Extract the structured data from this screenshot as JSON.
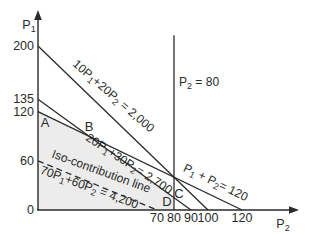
{
  "figure": {
    "background": "#ffffff",
    "ink_color": "#2a2a2a",
    "region_fill": "#ececec"
  },
  "chart_data": {
    "type": "line",
    "title": "",
    "grid": false,
    "legend": false,
    "x_axis": {
      "label": "P2",
      "label_parts": [
        {
          "t": "P"
        },
        {
          "t": "2",
          "sub": true
        }
      ],
      "range": [
        0,
        155
      ],
      "ticks": [
        70,
        80,
        90,
        100,
        120
      ]
    },
    "y_axis": {
      "label": "P1",
      "label_parts": [
        {
          "t": "P"
        },
        {
          "t": "1",
          "sub": true
        }
      ],
      "range": [
        0,
        240
      ],
      "ticks": [
        200,
        135,
        120,
        60,
        0
      ]
    },
    "series": [
      {
        "id": "line-2000",
        "name": "10P1+20P2 = 2,000",
        "style": "solid",
        "points": [
          [
            0,
            200
          ],
          [
            100,
            0
          ]
        ],
        "labels": [
          {
            "parts": [
              {
                "t": "10P"
              },
              {
                "t": "1",
                "sub": true
              },
              {
                "t": "+20P"
              },
              {
                "t": "2",
                "sub": true
              },
              {
                "t": " = 2,000"
              }
            ]
          }
        ]
      },
      {
        "id": "line-2700",
        "name": "20P1+30P2 = 2,700",
        "style": "solid",
        "points": [
          [
            0,
            135
          ],
          [
            90,
            0
          ]
        ],
        "labels": [
          {
            "parts": [
              {
                "t": "20P"
              },
              {
                "t": "1",
                "sub": true
              },
              {
                "t": "+30P"
              },
              {
                "t": "2",
                "sub": true
              },
              {
                "t": "= 2,700"
              }
            ]
          }
        ]
      },
      {
        "id": "line-120",
        "name": "P1 + P2 = 120",
        "style": "solid",
        "points": [
          [
            0,
            120
          ],
          [
            120,
            0
          ]
        ],
        "labels": [
          {
            "parts": [
              {
                "t": "P"
              },
              {
                "t": "1",
                "sub": true
              },
              {
                "t": " + P"
              },
              {
                "t": "2",
                "sub": true
              },
              {
                "t": "= 120"
              }
            ]
          }
        ]
      },
      {
        "id": "line-p2-80",
        "name": "P2 = 80",
        "style": "solid",
        "points": [
          [
            80,
            0
          ],
          [
            80,
            213
          ]
        ],
        "labels": [
          {
            "parts": [
              {
                "t": "P"
              },
              {
                "t": "2",
                "sub": true
              },
              {
                "t": " = 80"
              }
            ]
          }
        ]
      },
      {
        "id": "iso-line",
        "name": "Iso-contribution line 70P1+60P2 = 4,200",
        "style": "dashed",
        "points": [
          [
            0,
            60
          ],
          [
            70,
            0
          ]
        ],
        "labels": [
          {
            "parts": [
              {
                "t": "Iso-contribution line"
              }
            ]
          },
          {
            "parts": [
              {
                "t": "70P"
              },
              {
                "t": "1",
                "sub": true
              },
              {
                "t": "+60P"
              },
              {
                "t": "2",
                "sub": true
              },
              {
                "t": " = 4,200"
              }
            ]
          }
        ]
      }
    ],
    "vertex_labels": [
      {
        "label": "A",
        "x": 0,
        "y": 120
      },
      {
        "label": "B",
        "x": 30,
        "y": 90
      },
      {
        "label": "C",
        "x": 80,
        "y": 15
      },
      {
        "label": "D",
        "x": 80,
        "y": 0
      }
    ],
    "feasible_region": {
      "vertices": [
        [
          0,
          0
        ],
        [
          0,
          120
        ],
        [
          30,
          90
        ],
        [
          80,
          15
        ],
        [
          80,
          0
        ]
      ]
    }
  }
}
